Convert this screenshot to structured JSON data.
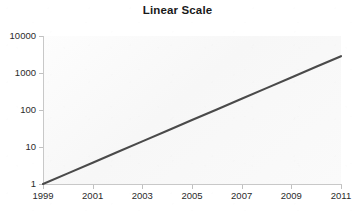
{
  "chart_data": {
    "type": "line",
    "title": "Linear Scale",
    "xlabel": "",
    "ylabel": "",
    "yscale": "log",
    "xscale": "linear",
    "grid": false,
    "legend": false,
    "xlim": [
      1999,
      2011
    ],
    "ylim": [
      1,
      10000
    ],
    "x_tick_labels": [
      "1999",
      "2001",
      "2003",
      "2005",
      "2007",
      "2009",
      "2011"
    ],
    "x_ticks": [
      1999,
      2001,
      2003,
      2005,
      2007,
      2009,
      2011
    ],
    "y_tick_labels": [
      "10000",
      "1000",
      "100",
      "10",
      "1"
    ],
    "y_ticks": [
      10000,
      1000,
      100,
      10,
      1
    ],
    "series": [
      {
        "name": "exponential-growth",
        "color": "#4a4a4a",
        "x": [
          1999,
          2000,
          2001,
          2002,
          2003,
          2004,
          2005,
          2006,
          2007,
          2008,
          2009,
          2010,
          2011
        ],
        "y": [
          1,
          1.94,
          3.76,
          7.3,
          14.2,
          27.5,
          53.4,
          103.6,
          201,
          390,
          757,
          1468,
          2849
        ]
      }
    ]
  },
  "colors": {
    "line": "#4a4a4a",
    "axis": "#c8c8c8",
    "tick": "#c0c0c0",
    "text": "#2b2b2b",
    "title": "#1a1a1a",
    "plot_background": "#fbfbfb",
    "figure_background": "#ffffff"
  },
  "axes": {
    "y_labels": [
      {
        "text": "10000",
        "value": 10000
      },
      {
        "text": "1000",
        "value": 1000
      },
      {
        "text": "100",
        "value": 100
      },
      {
        "text": "10",
        "value": 10
      },
      {
        "text": "1",
        "value": 1
      }
    ],
    "x_labels": [
      {
        "text": "1999",
        "value": 1999
      },
      {
        "text": "2001",
        "value": 2001
      },
      {
        "text": "2003",
        "value": 2003
      },
      {
        "text": "2005",
        "value": 2005
      },
      {
        "text": "2007",
        "value": 2007
      },
      {
        "text": "2009",
        "value": 2009
      },
      {
        "text": "2011",
        "value": 2011
      }
    ]
  }
}
